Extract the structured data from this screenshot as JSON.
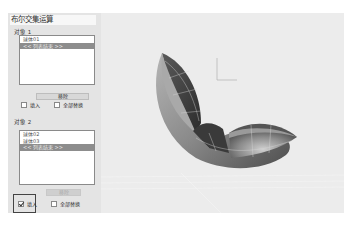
{
  "panel": {
    "title": "布尔交集运算",
    "object1": {
      "label": "对象 1",
      "items": [
        {
          "text": "球体01",
          "selected": false
        },
        {
          "text": "<< 列表结束 >>",
          "selected": true
        }
      ],
      "remove_button": "移除",
      "fill_checkbox": {
        "label": "填入",
        "checked": false
      },
      "replace_all_checkbox": {
        "label": "全部替换",
        "checked": false
      }
    },
    "object2": {
      "label": "对象 2",
      "items": [
        {
          "text": "球体02",
          "selected": false
        },
        {
          "text": "球体03",
          "selected": false
        },
        {
          "text": "<< 列表结束 >>",
          "selected": true
        }
      ],
      "remove_button": "移除",
      "fill_checkbox": {
        "label": "填入",
        "checked": true
      },
      "replace_all_checkbox": {
        "label": "全部替换",
        "checked": false
      }
    }
  },
  "viewport": {
    "object": "sphere-intersection-model",
    "background": "#ececec",
    "axis_indicator": "xy-axis-icon"
  }
}
